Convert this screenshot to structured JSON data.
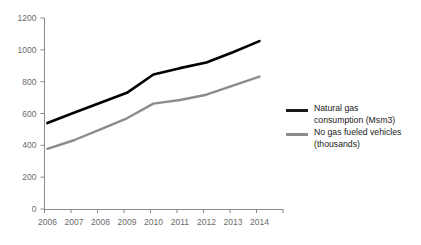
{
  "chart_data": {
    "type": "line",
    "title": "",
    "xlabel": "",
    "ylabel": "",
    "categories": [
      "2006",
      "2007",
      "2008",
      "2009",
      "2010",
      "2011",
      "2012",
      "2013",
      "2014"
    ],
    "x": [
      2006,
      2007,
      2008,
      2009,
      2010,
      2011,
      2012,
      2013,
      2014
    ],
    "ylim": [
      0,
      1200
    ],
    "yticks": [
      0,
      200,
      400,
      600,
      800,
      1000,
      1200
    ],
    "ytick_labels": [
      "0",
      "200",
      "400",
      "600",
      "800",
      "1000",
      "1200"
    ],
    "grid": false,
    "legend_position": "right",
    "series": [
      {
        "name": "Natural gas consumption (Msm3)",
        "color": "#000000",
        "values": [
          540,
          605,
          668,
          730,
          845,
          885,
          920,
          985,
          1055
        ]
      },
      {
        "name": "No gas fueled vehicles (thousands)",
        "color": "#8c8c8c",
        "values": [
          378,
          432,
          500,
          570,
          662,
          685,
          718,
          775,
          832
        ]
      }
    ]
  },
  "legend": {
    "entries": [
      {
        "label": "Natural gas\nconsumption (Msm3)",
        "color": "#1a1a1a"
      },
      {
        "label": "No gas fueled vehicles\n(thousands)",
        "color": "#8c8c8c"
      }
    ]
  },
  "axis": {
    "line_color": "#8a8a8a",
    "label_color": "#6b6b6b"
  }
}
